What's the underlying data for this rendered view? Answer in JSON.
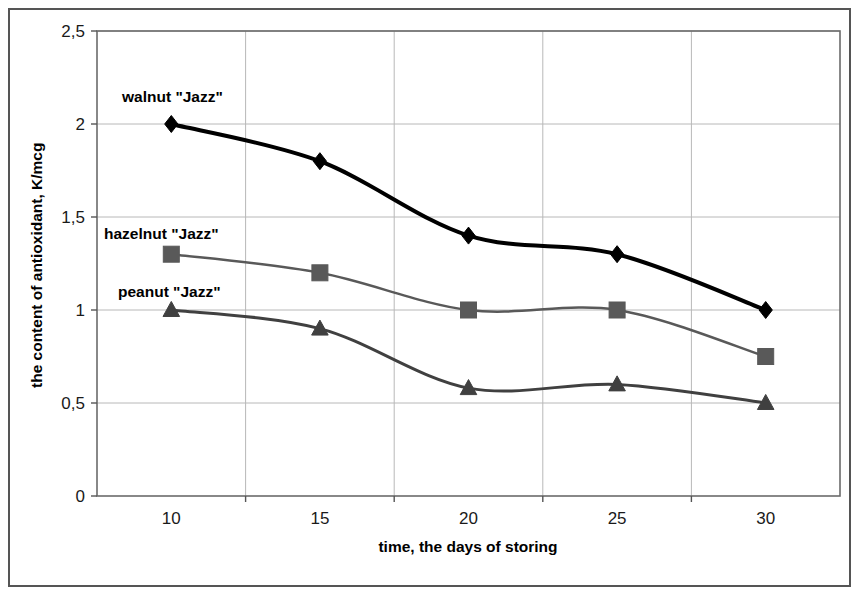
{
  "chart_data": {
    "type": "line",
    "title": "",
    "xlabel": "time, the days of storing",
    "ylabel": "the content of antioxidant, K/mcg",
    "x": [
      10,
      15,
      20,
      25,
      30
    ],
    "xtick_labels": [
      "10",
      "15",
      "20",
      "25",
      "30"
    ],
    "ytick_labels": [
      "0",
      "0,5",
      "1",
      "1,5",
      "2",
      "2,5"
    ],
    "ytick_values": [
      0,
      0.5,
      1,
      1.5,
      2,
      2.5
    ],
    "xlim": [
      7.5,
      32.5
    ],
    "ylim": [
      0,
      2.5
    ],
    "grid": true,
    "grid_axis": "both",
    "legend": "inline-annotations",
    "series": [
      {
        "name": "walnut \"Jazz\"",
        "marker": "diamond",
        "color": "#000000",
        "line_width": 4,
        "values": [
          2.0,
          1.8,
          1.4,
          1.3,
          1.0
        ]
      },
      {
        "name": "hazelnut \"Jazz\"",
        "marker": "square",
        "color": "#595959",
        "line_width": 2.5,
        "values": [
          1.3,
          1.2,
          1.0,
          1.0,
          0.75
        ]
      },
      {
        "name": "peanut \"Jazz\"",
        "marker": "triangle",
        "color": "#404040",
        "line_width": 3,
        "values": [
          1.0,
          0.9,
          0.58,
          0.6,
          0.5
        ]
      }
    ],
    "annotations": [
      {
        "text": "walnut \"Jazz\"",
        "x": 122,
        "y": 102
      },
      {
        "text": "hazelnut \"Jazz\"",
        "x": 104,
        "y": 239
      },
      {
        "text": "peanut \"Jazz\"",
        "x": 118,
        "y": 297
      }
    ]
  },
  "colors": {
    "plot_border": "#6b6b6b",
    "grid": "#b8b8b8",
    "outer_frame": "#555555",
    "background": "#ffffff",
    "walnut": "#000000",
    "hazelnut": "#595959",
    "peanut": "#404040"
  }
}
